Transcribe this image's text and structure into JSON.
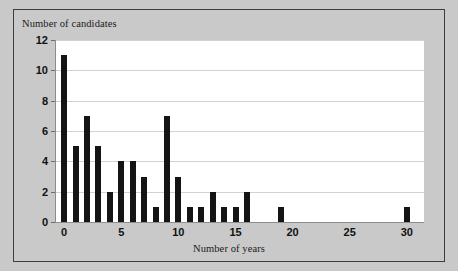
{
  "chart_data": {
    "type": "bar",
    "title": "",
    "xlabel": "Number of years",
    "ylabel": "Number of candidates",
    "categories": [
      0,
      1,
      2,
      3,
      4,
      5,
      6,
      7,
      8,
      9,
      10,
      11,
      12,
      13,
      14,
      15,
      16,
      19,
      30
    ],
    "values": [
      11,
      5,
      7,
      5,
      2,
      4,
      4,
      3,
      1,
      7,
      3,
      1,
      1,
      2,
      1,
      1,
      2,
      1,
      1
    ],
    "xlim": [
      -0.8,
      31.5
    ],
    "ylim": [
      0,
      12
    ],
    "xticks": [
      0,
      5,
      10,
      15,
      20,
      25,
      30
    ],
    "yticks": [
      0,
      2,
      4,
      6,
      8,
      10,
      12
    ],
    "xtick_labels": [
      "0",
      "5",
      "10",
      "15",
      "20",
      "25",
      "30"
    ],
    "ytick_labels": [
      "0",
      "2",
      "4",
      "6",
      "8",
      "10",
      "12"
    ],
    "grid": "horizontal",
    "legend": "none",
    "bar_color": "#141414",
    "plot_background": "#ffffff",
    "figure_background": "#c9c9c9",
    "gridline_color": "#d2d2d2",
    "border_color": "#3d3d3d"
  }
}
